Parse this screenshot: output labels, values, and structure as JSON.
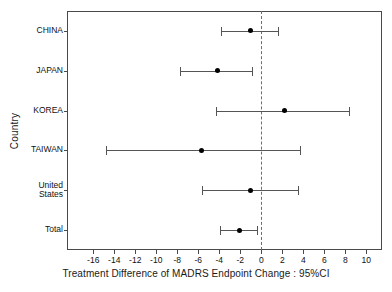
{
  "chart_data": {
    "type": "scatter",
    "subtype": "forest-plot",
    "title": "",
    "xlabel": "Treatment Difference of MADRS Endpoint Change : 95%CI",
    "ylabel": "Country",
    "xlim": [
      -18.5,
      11.5
    ],
    "xticks": [
      -16,
      -14,
      -12,
      -10,
      -8,
      -6,
      -4,
      -2,
      0,
      2,
      4,
      6,
      8,
      10
    ],
    "xticklabels": [
      "-16",
      "-14",
      "-12",
      "-10",
      "-8",
      "-6",
      "-4",
      "-2",
      "0",
      "2",
      "4",
      "6",
      "8",
      "10"
    ],
    "grid": false,
    "legend": null,
    "reference_line": 0,
    "reference_line_style": "dashed",
    "categories": [
      "CHINA",
      "JAPAN",
      "KOREA",
      "TAIWAN",
      "United\nStates",
      "Total"
    ],
    "estimates": [
      -1.0,
      -4.2,
      2.2,
      -5.7,
      -1.0,
      -2.1
    ],
    "ci_low": [
      -3.8,
      -7.7,
      -4.3,
      -14.8,
      -5.6,
      -3.9
    ],
    "ci_high": [
      1.6,
      -0.9,
      8.4,
      3.7,
      3.5,
      -0.4
    ],
    "points": [
      {
        "label": "CHINA",
        "estimate": -1.0,
        "ci_low": -3.8,
        "ci_high": 1.6
      },
      {
        "label": "JAPAN",
        "estimate": -4.2,
        "ci_low": -7.7,
        "ci_high": -0.9
      },
      {
        "label": "KOREA",
        "estimate": 2.2,
        "ci_low": -4.3,
        "ci_high": 8.4
      },
      {
        "label": "TAIWAN",
        "estimate": -5.7,
        "ci_low": -14.8,
        "ci_high": 3.7
      },
      {
        "label": "United\nStates",
        "estimate": -1.0,
        "ci_low": -5.6,
        "ci_high": 3.5
      },
      {
        "label": "Total",
        "estimate": -2.1,
        "ci_low": -3.9,
        "ci_high": -0.4
      }
    ],
    "colors": {
      "point": "#000000",
      "interval": "#555555",
      "axis": "#4a4a4a",
      "reference": "#6d6d6d",
      "background": "#ffffff"
    }
  }
}
